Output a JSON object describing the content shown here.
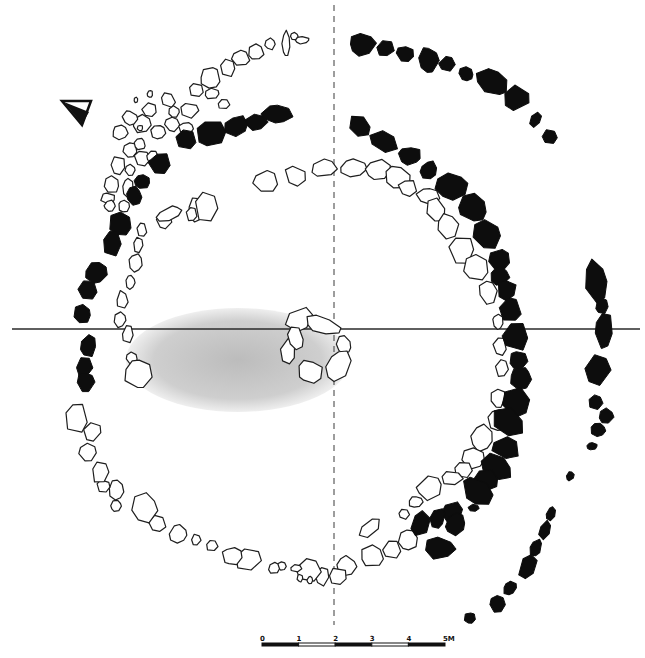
{
  "figure": {
    "type": "archaeological-site-plan"
  },
  "colors": {
    "background": "#ffffff",
    "filled_stone": "#0d0d0d",
    "outline_stone": "#1e1e1e",
    "stipple": "#b8b8b8"
  },
  "north_arrow": {
    "icon": "north-arrow-triangle",
    "x": 62,
    "y": 103
  },
  "axes": {
    "horizontal": {
      "y": 329,
      "x1": 12,
      "x2": 640,
      "style": "solid"
    },
    "vertical": {
      "x": 334,
      "y1": 5,
      "y2": 625,
      "style": "dashed"
    }
  },
  "scale_bar": {
    "labels": [
      "0",
      "1",
      "2",
      "3",
      "4",
      "5M"
    ],
    "unit": "M",
    "x_start": 262,
    "x_end": 445,
    "y": 643
  },
  "stippled_area": {
    "cx": 238,
    "cy": 360,
    "rx": 112,
    "ry": 52
  },
  "central_cist": {
    "stones": [
      [
        300,
        320,
        15,
        12,
        -30
      ],
      [
        322,
        325,
        20,
        9,
        20
      ],
      [
        344,
        345,
        8,
        10,
        0
      ],
      [
        338,
        366,
        12,
        18,
        30
      ],
      [
        310,
        372,
        14,
        12,
        15
      ],
      [
        288,
        352,
        8,
        14,
        10
      ],
      [
        296,
        338,
        8,
        13,
        -20
      ]
    ]
  },
  "inner_ring_stones": [
    [
      266,
      182,
      14,
      12,
      0
    ],
    [
      296,
      176,
      12,
      11,
      10
    ],
    [
      324,
      168,
      14,
      10,
      -5
    ],
    [
      353,
      168,
      14,
      10,
      0
    ],
    [
      378,
      170,
      13,
      11,
      0
    ],
    [
      398,
      178,
      14,
      12,
      15
    ],
    [
      408,
      188,
      10,
      9,
      0
    ],
    [
      428,
      196,
      12,
      9,
      0
    ],
    [
      436,
      210,
      10,
      14,
      -20
    ],
    [
      448,
      226,
      11,
      13,
      -10
    ],
    [
      462,
      250,
      14,
      16,
      -10
    ],
    [
      476,
      268,
      13,
      13,
      0
    ],
    [
      488,
      292,
      9,
      13,
      -10
    ],
    [
      498,
      322,
      6,
      8,
      0
    ],
    [
      500,
      346,
      7,
      10,
      0
    ],
    [
      502,
      368,
      7,
      10,
      0
    ],
    [
      498,
      398,
      8,
      10,
      0
    ],
    [
      498,
      420,
      10,
      12,
      0
    ],
    [
      482,
      438,
      12,
      14,
      0
    ],
    [
      474,
      458,
      12,
      12,
      0
    ],
    [
      464,
      470,
      10,
      9,
      0
    ],
    [
      452,
      478,
      12,
      8,
      0
    ],
    [
      430,
      488,
      14,
      12,
      -20
    ],
    [
      416,
      502,
      8,
      6,
      0
    ],
    [
      404,
      514,
      6,
      6,
      0
    ],
    [
      370,
      528,
      14,
      7,
      -45
    ],
    [
      408,
      540,
      10,
      12,
      -20
    ],
    [
      392,
      550,
      10,
      10,
      0
    ],
    [
      372,
      556,
      12,
      11,
      0
    ],
    [
      346,
      566,
      11,
      10,
      0
    ],
    [
      338,
      576,
      10,
      9,
      0
    ],
    [
      322,
      576,
      8,
      10,
      10
    ],
    [
      310,
      570,
      14,
      12,
      0
    ],
    [
      296,
      568,
      6,
      4,
      0
    ],
    [
      300,
      578,
      3,
      4,
      0
    ],
    [
      310,
      580,
      3,
      4,
      0
    ],
    [
      282,
      566,
      5,
      5,
      0
    ],
    [
      274,
      568,
      6,
      6,
      0
    ],
    [
      248,
      560,
      14,
      12,
      0
    ],
    [
      232,
      556,
      10,
      10,
      0
    ],
    [
      212,
      546,
      6,
      6,
      0
    ],
    [
      196,
      540,
      5,
      6,
      0
    ],
    [
      178,
      534,
      10,
      10,
      0
    ],
    [
      158,
      524,
      10,
      9,
      0
    ],
    [
      144,
      508,
      14,
      16,
      0
    ],
    [
      116,
      506,
      6,
      6,
      0
    ],
    [
      116,
      490,
      8,
      10,
      0
    ],
    [
      104,
      486,
      7,
      7,
      0
    ],
    [
      100,
      472,
      9,
      12,
      0
    ],
    [
      88,
      452,
      10,
      10,
      0
    ],
    [
      92,
      432,
      10,
      10,
      0
    ],
    [
      76,
      418,
      12,
      16,
      0
    ],
    [
      128,
      334,
      6,
      10,
      0
    ],
    [
      132,
      358,
      6,
      7,
      0
    ],
    [
      138,
      374,
      14,
      16,
      0
    ],
    [
      120,
      320,
      6,
      8,
      0
    ],
    [
      122,
      300,
      6,
      10,
      0
    ],
    [
      130,
      282,
      5,
      8,
      0
    ],
    [
      136,
      262,
      7,
      10,
      0
    ],
    [
      138,
      245,
      5,
      8,
      0
    ],
    [
      142,
      230,
      5,
      8,
      0
    ],
    [
      164,
      220,
      8,
      9,
      0
    ],
    [
      170,
      214,
      14,
      7,
      -20
    ],
    [
      196,
      210,
      8,
      14,
      0
    ],
    [
      206,
      206,
      12,
      16,
      0
    ],
    [
      192,
      214,
      6,
      8,
      0
    ]
  ],
  "outer_kerb_stones": [
    [
      362,
      44,
      14,
      12,
      -10
    ],
    [
      385,
      48,
      10,
      9,
      0
    ],
    [
      405,
      54,
      10,
      8,
      10
    ],
    [
      428,
      60,
      11,
      14,
      0
    ],
    [
      447,
      64,
      9,
      9,
      0
    ],
    [
      466,
      74,
      8,
      7,
      30
    ],
    [
      492,
      82,
      18,
      14,
      20
    ],
    [
      516,
      98,
      14,
      14,
      20
    ],
    [
      535,
      120,
      6,
      8,
      30
    ],
    [
      550,
      137,
      8,
      8,
      0
    ],
    [
      360,
      126,
      10,
      13,
      -20
    ],
    [
      384,
      142,
      16,
      12,
      20
    ],
    [
      410,
      156,
      12,
      10,
      0
    ],
    [
      429,
      170,
      9,
      10,
      20
    ],
    [
      451,
      186,
      18,
      14,
      25
    ],
    [
      472,
      208,
      16,
      14,
      40
    ],
    [
      487,
      234,
      16,
      14,
      50
    ],
    [
      500,
      260,
      12,
      12,
      60
    ],
    [
      500,
      276,
      10,
      10,
      0
    ],
    [
      506,
      290,
      10,
      12,
      20
    ],
    [
      510,
      310,
      12,
      12,
      0
    ],
    [
      516,
      336,
      14,
      16,
      0
    ],
    [
      518,
      360,
      10,
      10,
      0
    ],
    [
      521,
      378,
      12,
      12,
      0
    ],
    [
      516,
      402,
      16,
      16,
      30
    ],
    [
      508,
      422,
      18,
      14,
      30
    ],
    [
      506,
      448,
      16,
      12,
      20
    ],
    [
      496,
      466,
      18,
      12,
      30
    ],
    [
      486,
      480,
      14,
      12,
      20
    ],
    [
      478,
      492,
      18,
      14,
      40
    ],
    [
      474,
      508,
      6,
      4,
      0
    ],
    [
      452,
      512,
      10,
      12,
      40
    ],
    [
      438,
      518,
      8,
      12,
      20
    ],
    [
      440,
      548,
      16,
      12,
      0
    ],
    [
      456,
      524,
      10,
      12,
      30
    ],
    [
      420,
      524,
      10,
      14,
      30
    ],
    [
      276,
      114,
      18,
      10,
      0
    ],
    [
      256,
      122,
      12,
      8,
      -10
    ],
    [
      236,
      126,
      14,
      10,
      -20
    ],
    [
      210,
      134,
      16,
      14,
      -20
    ],
    [
      186,
      140,
      12,
      10,
      0
    ],
    [
      160,
      164,
      12,
      12,
      0
    ],
    [
      142,
      182,
      8,
      8,
      0
    ],
    [
      134,
      196,
      8,
      10,
      0
    ],
    [
      120,
      224,
      12,
      14,
      0
    ],
    [
      112,
      244,
      10,
      14,
      0
    ],
    [
      96,
      272,
      12,
      12,
      0
    ],
    [
      88,
      290,
      10,
      10,
      0
    ],
    [
      82,
      314,
      9,
      10,
      0
    ],
    [
      88,
      346,
      9,
      12,
      0
    ],
    [
      84,
      368,
      9,
      12,
      0
    ],
    [
      86,
      382,
      10,
      10,
      0
    ]
  ],
  "far_outer_stones": [
    [
      596,
      282,
      12,
      24,
      -10
    ],
    [
      602,
      306,
      7,
      8,
      0
    ],
    [
      604,
      330,
      10,
      20,
      0
    ],
    [
      598,
      370,
      13,
      18,
      0
    ],
    [
      596,
      402,
      8,
      8,
      0
    ],
    [
      606,
      416,
      8,
      8,
      0
    ],
    [
      598,
      430,
      8,
      8,
      0
    ],
    [
      592,
      446,
      6,
      4,
      0
    ],
    [
      570,
      476,
      4,
      5,
      30
    ],
    [
      551,
      514,
      5,
      8,
      20
    ],
    [
      545,
      530,
      6,
      10,
      20
    ],
    [
      536,
      548,
      6,
      10,
      20
    ],
    [
      528,
      566,
      9,
      14,
      25
    ],
    [
      510,
      588,
      6,
      8,
      40
    ],
    [
      498,
      604,
      8,
      10,
      0
    ],
    [
      470,
      618,
      6,
      6,
      0
    ]
  ],
  "upper_rubble_stones": [
    [
      302,
      40,
      8,
      4,
      0
    ],
    [
      294,
      36,
      4,
      4,
      0
    ],
    [
      286,
      44,
      4,
      14,
      0
    ],
    [
      270,
      44,
      6,
      6,
      0
    ],
    [
      256,
      52,
      8,
      8,
      0
    ],
    [
      240,
      58,
      10,
      8,
      0
    ],
    [
      228,
      68,
      8,
      9,
      0
    ],
    [
      210,
      78,
      10,
      12,
      0
    ],
    [
      196,
      90,
      8,
      8,
      0
    ],
    [
      212,
      94,
      8,
      6,
      0
    ],
    [
      224,
      104,
      6,
      6,
      0
    ],
    [
      190,
      110,
      10,
      8,
      0
    ],
    [
      168,
      100,
      8,
      8,
      0
    ],
    [
      150,
      110,
      8,
      8,
      0
    ],
    [
      142,
      124,
      10,
      10,
      0
    ],
    [
      130,
      118,
      8,
      8,
      0
    ],
    [
      120,
      132,
      8,
      8,
      0
    ],
    [
      158,
      132,
      8,
      8,
      0
    ],
    [
      172,
      124,
      8,
      8,
      0
    ],
    [
      186,
      128,
      8,
      6,
      0
    ],
    [
      174,
      112,
      6,
      6,
      0
    ],
    [
      130,
      150,
      8,
      8,
      0
    ],
    [
      142,
      158,
      8,
      8,
      0
    ],
    [
      118,
      166,
      8,
      10,
      0
    ],
    [
      130,
      170,
      6,
      6,
      0
    ],
    [
      112,
      184,
      8,
      10,
      0
    ],
    [
      128,
      188,
      6,
      10,
      0
    ],
    [
      108,
      198,
      8,
      6,
      0
    ],
    [
      124,
      206,
      6,
      6,
      0
    ],
    [
      140,
      144,
      6,
      6,
      0
    ],
    [
      152,
      156,
      6,
      6,
      0
    ],
    [
      110,
      206,
      6,
      6,
      0
    ],
    [
      150,
      94,
      3,
      4,
      0
    ],
    [
      136,
      100,
      2,
      3,
      0
    ],
    [
      140,
      128,
      3,
      3,
      0
    ]
  ]
}
